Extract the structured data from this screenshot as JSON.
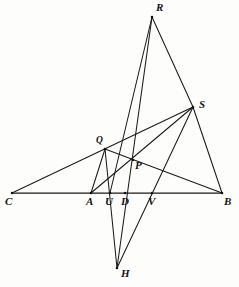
{
  "figure": {
    "background_color": "#fdfdfb",
    "ink_color": "#1a1a1a",
    "width": 239,
    "height": 287
  },
  "points": [
    {
      "id": "R",
      "label": "R",
      "x": 152,
      "y": 17,
      "label_x": 156,
      "label_y": 2,
      "size": "normal"
    },
    {
      "id": "S",
      "label": "S",
      "x": 193,
      "y": 107,
      "label_x": 199,
      "label_y": 99,
      "size": "normal"
    },
    {
      "id": "Q",
      "label": "Q",
      "x": 105,
      "y": 149,
      "label_x": 96,
      "label_y": 136,
      "size": "small"
    },
    {
      "id": "P",
      "label": "P",
      "x": 133,
      "y": 160,
      "label_x": 135,
      "label_y": 160,
      "size": "normal"
    },
    {
      "id": "C",
      "label": "C",
      "x": 12,
      "y": 193,
      "label_x": 5,
      "label_y": 196,
      "size": "normal"
    },
    {
      "id": "A",
      "label": "A",
      "x": 91,
      "y": 193,
      "label_x": 86,
      "label_y": 196,
      "size": "normal"
    },
    {
      "id": "U",
      "label": "U",
      "x": 110,
      "y": 193,
      "label_x": 105,
      "label_y": 196,
      "size": "normal"
    },
    {
      "id": "D",
      "label": "D",
      "x": 125,
      "y": 193,
      "label_x": 121,
      "label_y": 196,
      "size": "normal"
    },
    {
      "id": "V",
      "label": "V",
      "x": 152,
      "y": 193,
      "label_x": 148,
      "label_y": 196,
      "size": "normal"
    },
    {
      "id": "B",
      "label": "B",
      "x": 222,
      "y": 193,
      "label_x": 224,
      "label_y": 196,
      "size": "normal"
    },
    {
      "id": "H",
      "label": "H",
      "x": 117,
      "y": 268,
      "label_x": 121,
      "label_y": 268,
      "size": "normal"
    }
  ],
  "segments": [
    {
      "id": "C-B",
      "from": "C",
      "to": "B",
      "kind": "base",
      "name": "baseline-c-b"
    },
    {
      "id": "C-S",
      "from": "C",
      "to": "S",
      "kind": "line",
      "name": "line-c-s"
    },
    {
      "id": "R-U",
      "from": "R",
      "to": "U",
      "kind": "line",
      "name": "line-r-u"
    },
    {
      "id": "R-S",
      "from": "R",
      "to": "S",
      "kind": "line",
      "name": "line-r-s"
    },
    {
      "id": "R-H",
      "from": "R",
      "to": "H",
      "kind": "line",
      "name": "line-r-h"
    },
    {
      "id": "S-B",
      "from": "S",
      "to": "B",
      "kind": "line",
      "name": "line-s-b"
    },
    {
      "id": "S-A",
      "from": "S",
      "to": "A",
      "kind": "line",
      "name": "line-s-a"
    },
    {
      "id": "S-H",
      "from": "S",
      "to": "H",
      "kind": "line",
      "name": "line-s-h"
    },
    {
      "id": "Q-B",
      "from": "Q",
      "to": "B",
      "kind": "line",
      "name": "line-q-b"
    },
    {
      "id": "Q-A",
      "from": "Q",
      "to": "A",
      "kind": "line",
      "name": "line-q-a"
    },
    {
      "id": "Q-H",
      "from": "Q",
      "to": "H",
      "kind": "line",
      "name": "line-q-h"
    }
  ],
  "notes": {
    "baseline_points": [
      "C",
      "A",
      "U",
      "D",
      "V",
      "B"
    ],
    "interior_points": [
      "Q",
      "P"
    ],
    "outer_points": [
      "R",
      "S",
      "H"
    ]
  }
}
